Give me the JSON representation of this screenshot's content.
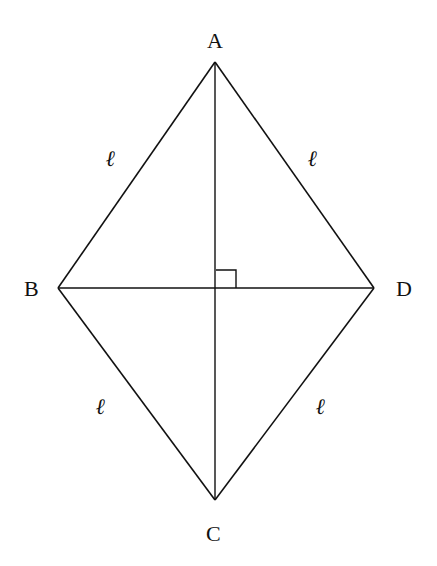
{
  "figure": {
    "type": "rhombus",
    "vertices": {
      "A": {
        "label": "A",
        "x": 215,
        "y": 62
      },
      "B": {
        "label": "B",
        "x": 58,
        "y": 288
      },
      "C": {
        "label": "C",
        "x": 215,
        "y": 500
      },
      "D": {
        "label": "D",
        "x": 374,
        "y": 288
      }
    },
    "side_labels": {
      "AB": "ℓ",
      "AD": "ℓ",
      "BC": "ℓ",
      "CD": "ℓ"
    },
    "diagonals": [
      "AC",
      "BD"
    ],
    "right_angle_marker": {
      "at": "intersection",
      "x": 215,
      "y": 288,
      "size": 20
    },
    "stroke_color": "#111111",
    "background_color": "#ffffff"
  }
}
